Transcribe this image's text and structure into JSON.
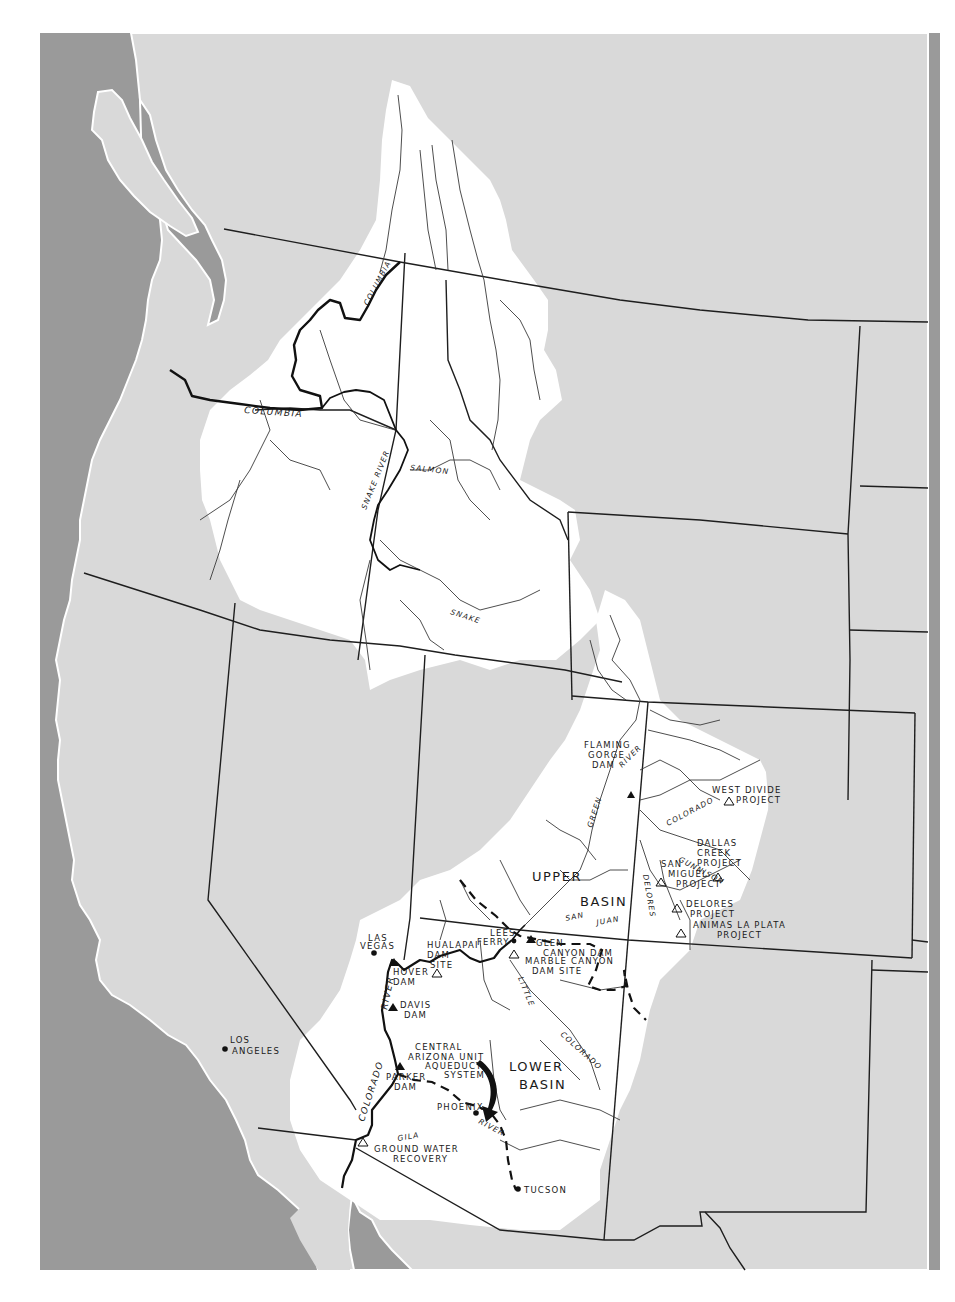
{
  "map": {
    "colors": {
      "ocean": "#9a9a9a",
      "land": "#d9d9d9",
      "basin": "#ffffff",
      "border": "#1e1e1e",
      "river": "#3a3a3a",
      "paper": "#ffffff"
    },
    "basins": [
      {
        "id": "upper",
        "line1": "UPPER",
        "line2": "BASIN"
      },
      {
        "id": "lower",
        "line1": "LOWER",
        "line2": "BASIN"
      }
    ],
    "rivers": {
      "columbia_main": "COLUMBIA",
      "columbia_upper": "COLUMBIA",
      "snake_river": "SNAKE RIVER",
      "salmon": "SALMON",
      "snake": "SNAKE",
      "green": "GREEN",
      "green_river": "RIVER",
      "colorado_upper": "COLORADO",
      "gunnison": "GUNNISON",
      "delores_river": "DELORES",
      "san": "SAN",
      "juan": "JUAN",
      "little": "LITTLE",
      "colorado_little": "COLORADO",
      "river_lower": "RIVER",
      "colorado_lower": "COLORADO",
      "gila": "GILA",
      "gila_river": "RIVER"
    },
    "dams": [
      {
        "id": "flaming-gorge",
        "lines": [
          "FLAMING",
          "GORGE",
          "DAM"
        ],
        "status": "existing",
        "icon": "filled-triangle"
      },
      {
        "id": "glen-canyon",
        "lines": [
          "GLEN",
          "CANYON DAM"
        ],
        "status": "existing",
        "icon": "filled-triangle"
      },
      {
        "id": "hover",
        "lines": [
          "HOVER",
          "DAM"
        ],
        "status": "existing",
        "icon": "filled-triangle"
      },
      {
        "id": "davis",
        "lines": [
          "DAVIS",
          "DAM"
        ],
        "status": "existing",
        "icon": "filled-triangle"
      },
      {
        "id": "parker",
        "lines": [
          "PARKER",
          "DAM"
        ],
        "status": "existing",
        "icon": "filled-triangle"
      },
      {
        "id": "hualapai",
        "lines": [
          "HUALAPAI",
          "DAM",
          "SITE"
        ],
        "status": "proposed",
        "icon": "open-triangle"
      },
      {
        "id": "marble-canyon",
        "lines": [
          "MARBLE CANYON",
          "DAM SITE"
        ],
        "status": "proposed",
        "icon": "open-triangle"
      }
    ],
    "projects": [
      {
        "id": "west-divide",
        "lines": [
          "WEST DIVIDE",
          "PROJECT"
        ],
        "icon": "open-triangle"
      },
      {
        "id": "dallas-creek",
        "lines": [
          "DALLAS",
          "CREEK",
          "PROJECT"
        ],
        "icon": "open-triangle"
      },
      {
        "id": "san-miguel",
        "lines": [
          "SAN",
          "MIGUEL",
          "PROJECT"
        ],
        "icon": "open-triangle"
      },
      {
        "id": "delores",
        "lines": [
          "DELORES",
          "PROJECT"
        ],
        "icon": "open-triangle"
      },
      {
        "id": "animas-la-plata",
        "lines": [
          "ANIMAS LA PLATA",
          "PROJECT"
        ],
        "icon": "open-triangle"
      },
      {
        "id": "ground-water",
        "lines": [
          "GROUND WATER",
          "RECOVERY"
        ],
        "icon": "open-triangle"
      }
    ],
    "cities": [
      {
        "id": "las-vegas",
        "lines": [
          "LAS",
          "VEGAS"
        ]
      },
      {
        "id": "lees-ferry",
        "lines": [
          "LEES",
          "FERRY"
        ]
      },
      {
        "id": "los-angeles",
        "lines": [
          "LOS",
          "ANGELES"
        ]
      },
      {
        "id": "phoenix",
        "lines": [
          "PHOENIX"
        ]
      },
      {
        "id": "tucson",
        "lines": [
          "TUCSON"
        ]
      }
    ],
    "aqueduct": {
      "lines": [
        "CENTRAL",
        "ARIZONA UNIT",
        "AQUEDUCT",
        "SYSTEM"
      ]
    }
  }
}
